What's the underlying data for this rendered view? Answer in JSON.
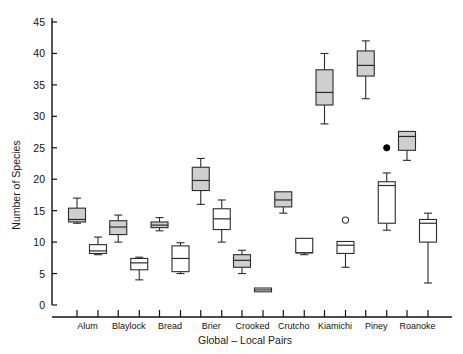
{
  "chart_data": {
    "type": "box",
    "title": "",
    "xlabel": "Global – Local Pairs",
    "ylabel": "Number of Species",
    "ylim": [
      0,
      47
    ],
    "yticks": [
      0,
      5,
      10,
      15,
      20,
      25,
      30,
      35,
      40,
      45
    ],
    "grid": false,
    "legend": "none",
    "categories": [
      "Alum",
      "Blaylock",
      "Bread",
      "Brier",
      "Crooked",
      "Crutcho",
      "Kiamichi",
      "Piney",
      "Roanoke"
    ],
    "series": [
      {
        "name": "Global",
        "fill": "#cfcfcf",
        "boxes": [
          {
            "category": "Alum",
            "whisker_low": 13.0,
            "q1": 13.2,
            "median": 13.6,
            "q3": 15.4,
            "whisker_high": 17.0,
            "outliers": []
          },
          {
            "category": "Blaylock",
            "whisker_low": 10.0,
            "q1": 11.2,
            "median": 12.4,
            "q3": 13.4,
            "whisker_high": 14.3,
            "outliers": []
          },
          {
            "category": "Bread",
            "whisker_low": 11.8,
            "q1": 12.3,
            "median": 12.7,
            "q3": 13.2,
            "whisker_high": 13.9,
            "outliers": []
          },
          {
            "category": "Brier",
            "whisker_low": 16.0,
            "q1": 18.2,
            "median": 19.8,
            "q3": 21.9,
            "whisker_high": 23.3,
            "outliers": []
          },
          {
            "category": "Crooked",
            "whisker_low": 5.0,
            "q1": 6.0,
            "median": 7.1,
            "q3": 8.0,
            "whisker_high": 8.7,
            "outliers": []
          },
          {
            "category": "Crutcho",
            "whisker_low": 14.6,
            "q1": 15.6,
            "median": 16.7,
            "q3": 18.0,
            "whisker_high": 18.0,
            "outliers": []
          },
          {
            "category": "Kiamichi",
            "whisker_low": 28.8,
            "q1": 31.8,
            "median": 33.8,
            "q3": 37.4,
            "whisker_high": 40.0,
            "outliers": []
          },
          {
            "category": "Piney",
            "whisker_low": 32.8,
            "q1": 36.4,
            "median": 38.1,
            "q3": 40.4,
            "whisker_high": 42.0,
            "outliers": []
          },
          {
            "category": "Roanoke",
            "whisker_low": 23.0,
            "q1": 24.6,
            "median": 26.8,
            "q3": 27.6,
            "whisker_high": 27.6,
            "outliers": []
          }
        ]
      },
      {
        "name": "Local",
        "fill": "#ffffff",
        "boxes": [
          {
            "category": "Alum",
            "whisker_low": 8.0,
            "q1": 8.2,
            "median": 8.6,
            "q3": 9.6,
            "whisker_high": 10.8,
            "outliers": []
          },
          {
            "category": "Blaylock",
            "whisker_low": 4.0,
            "q1": 5.6,
            "median": 6.7,
            "q3": 7.4,
            "whisker_high": 7.6,
            "outliers": []
          },
          {
            "category": "Bread",
            "whisker_low": 5.0,
            "q1": 5.3,
            "median": 7.4,
            "q3": 9.4,
            "whisker_high": 9.9,
            "outliers": []
          },
          {
            "category": "Brier",
            "whisker_low": 10.0,
            "q1": 12.0,
            "median": 13.7,
            "q3": 15.3,
            "whisker_high": 16.7,
            "outliers": []
          },
          {
            "category": "Crooked",
            "whisker_low": 2.1,
            "q1": 2.1,
            "median": 2.4,
            "q3": 2.7,
            "whisker_high": 2.7,
            "outliers": []
          },
          {
            "category": "Crutcho",
            "whisker_low": 8.0,
            "q1": 8.3,
            "median": 8.3,
            "q3": 10.6,
            "whisker_high": 10.6,
            "outliers": []
          },
          {
            "category": "Kiamichi",
            "whisker_low": 6.0,
            "q1": 8.2,
            "median": 9.5,
            "q3": 10.1,
            "whisker_high": 10.1,
            "outliers": [
              13.5
            ]
          },
          {
            "category": "Piney",
            "whisker_low": 11.9,
            "q1": 13.0,
            "median": 19.0,
            "q3": 19.6,
            "whisker_high": 21.0,
            "outliers": [
              25.0
            ]
          },
          {
            "category": "Roanoke",
            "whisker_low": 3.5,
            "q1": 10.0,
            "median": 13.0,
            "q3": 13.6,
            "whisker_high": 14.6,
            "outliers": []
          }
        ]
      }
    ]
  }
}
